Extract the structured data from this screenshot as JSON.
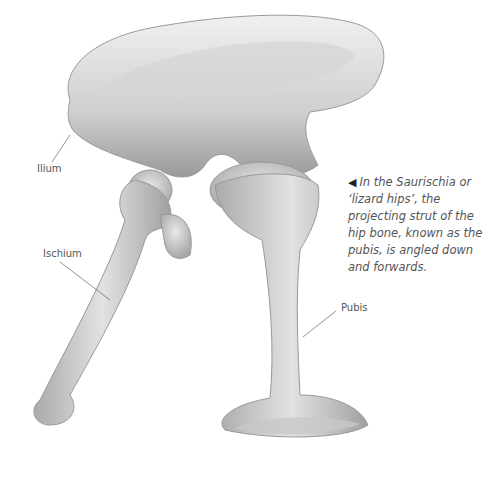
{
  "figure": {
    "labels": {
      "ilium": "Ilium",
      "ischium": "Ischium",
      "pubis": "Pubis"
    },
    "caption": {
      "arrow_icon": "◀",
      "text": "In the Saurischia or ‘lizard hips’, the projecting strut of the hip bone, known as the pubis, is angled down and forwards."
    },
    "colors": {
      "bone_light": "#e6e6e6",
      "bone_mid": "#bdbdbd",
      "bone_dark": "#8a8a8a",
      "leader_line": "#777777"
    }
  }
}
